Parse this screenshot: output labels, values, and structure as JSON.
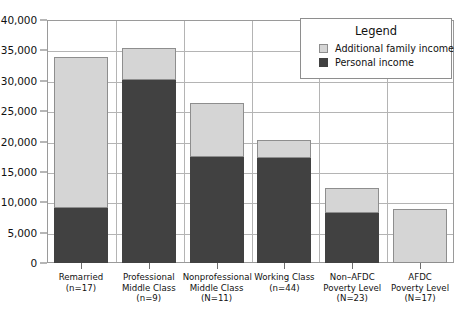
{
  "chart_data": {
    "type": "bar",
    "stacked": true,
    "title": "",
    "xlabel": "",
    "ylabel": "",
    "ylim": [
      0,
      40000
    ],
    "ytick_values": [
      0,
      5000,
      10000,
      15000,
      20000,
      25000,
      30000,
      35000,
      40000
    ],
    "ytick_labels": [
      "0",
      "5,000",
      "10,000",
      "15,000",
      "20,000",
      "25,000",
      "30,000",
      "35,000",
      "40,000"
    ],
    "grid": true,
    "legend_position": "top-right",
    "categories": [
      "Remarried",
      "Professional Middle Class",
      "Nonprofessional Middle Class",
      "Working Class",
      "Non–AFDC Poverty Level",
      "AFDC Poverty Level"
    ],
    "category_labels": [
      {
        "lines": [
          "Remarried",
          "(n=17)"
        ]
      },
      {
        "lines": [
          "Professional",
          "Middle Class",
          "(n=9)"
        ]
      },
      {
        "lines": [
          "Nonprofessional",
          "Middle Class",
          "(N=11)"
        ]
      },
      {
        "lines": [
          "Working Class",
          "(n=44)"
        ]
      },
      {
        "lines": [
          "Non–AFDC",
          "Poverty Level",
          "(N=23)"
        ]
      },
      {
        "lines": [
          "AFDC",
          "Poverty Level",
          "(N=17)"
        ]
      }
    ],
    "sample_sizes": [
      17,
      9,
      11,
      44,
      23,
      17
    ],
    "series": [
      {
        "name": "Personal income",
        "color": "#414141",
        "values": [
          9000,
          30200,
          17500,
          17300,
          8200,
          0
        ]
      },
      {
        "name": "Additional family income",
        "color": "#d5d5d5",
        "values": [
          24900,
          5200,
          8900,
          3000,
          4200,
          8900
        ]
      }
    ],
    "totals": [
      33900,
      35400,
      26400,
      20300,
      12400,
      8900
    ]
  },
  "legend": {
    "title": "Legend",
    "entries": [
      {
        "label": "Additional family income",
        "swatch": "light-gray-swatch"
      },
      {
        "label": "Personal income",
        "swatch": "dark-gray-swatch"
      }
    ]
  },
  "colors": {
    "additional_family_income": "#d5d5d5",
    "personal_income": "#414141",
    "gridline": "#b4b4b4",
    "frame": "#9a9a9a",
    "text": "#111111",
    "background": "#ffffff"
  }
}
